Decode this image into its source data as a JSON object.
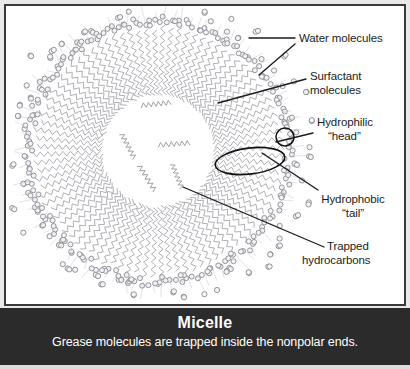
{
  "figure": {
    "labels": [
      {
        "id": "water",
        "text": "Water molecules",
        "line1": "Water molecules",
        "line2": ""
      },
      {
        "id": "surf",
        "text": "Surfactant molecules",
        "line1": "Surfactant",
        "line2": "molecules"
      },
      {
        "id": "head",
        "text": "Hydrophilic “head”",
        "line1": "Hydrophilic",
        "line2": "“head”"
      },
      {
        "id": "tail",
        "text": "Hydrophobic “tail”",
        "line1": "Hydrophobic",
        "line2": "“tail”"
      },
      {
        "id": "trapped",
        "text": "Trapped hydrocarbons",
        "line1": "Trapped",
        "line2": "hydrocarbons"
      }
    ],
    "caption": {
      "title": "Micelle",
      "subtitle": "Grease molecules are trapped inside the nonpolar ends."
    },
    "colors": {
      "panel_background": "#ffffff",
      "panel_border": "#3a3a3a",
      "caption_background": "#2b2b2b",
      "caption_text": "#ffffff",
      "label_text": "#1b1b1b",
      "leader_line": "#1b1b1b",
      "molecule_stroke": "#9a9aa2",
      "water_stroke": "#8f8f98",
      "highlight_outline": "#111111",
      "figure_background": "#e9e9e9"
    },
    "diagram": {
      "type": "micelle-cross-section",
      "center_x": 152,
      "center_y": 145,
      "core_radius": 54,
      "surfactant_count": 92,
      "surfactant_chain_length": 9,
      "shell_inner_radius": 56,
      "shell_outer_radius": 124,
      "water_cluster_count": 78,
      "water_molecule_radius": 2.6,
      "trapped_hydrocarbon_count": 5,
      "highlight_head_circle": {
        "cx": 279,
        "cy": 131,
        "r": 9
      },
      "highlight_tail_ellipse": {
        "cx": 244,
        "cy": 155,
        "rx": 35,
        "ry": 13,
        "rotate": -7
      }
    },
    "leaders": [
      {
        "id": "water-1",
        "x1": 289,
        "y1": 32,
        "x2": 243,
        "y2": 32
      },
      {
        "id": "water-2",
        "x1": 289,
        "y1": 38,
        "x2": 253,
        "y2": 69
      },
      {
        "id": "surf",
        "x1": 300,
        "y1": 73,
        "x2": 212,
        "y2": 97
      },
      {
        "id": "head",
        "x1": 307,
        "y1": 127,
        "x2": 270,
        "y2": 136
      },
      {
        "id": "tail",
        "x1": 312,
        "y1": 184,
        "x2": 256,
        "y2": 147
      },
      {
        "id": "trapped",
        "x1": 318,
        "y1": 241,
        "x2": 177,
        "y2": 181
      }
    ]
  }
}
